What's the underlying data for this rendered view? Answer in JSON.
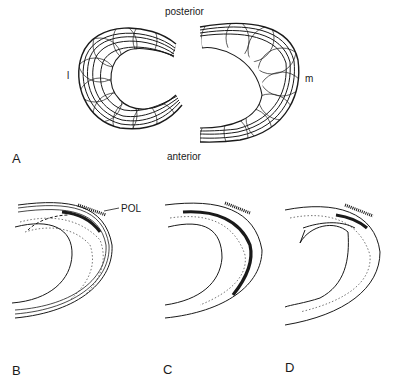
{
  "figure": {
    "panel_a": {
      "letter": "A",
      "labels": {
        "top": "posterior",
        "bottom": "anterior",
        "left": "l",
        "right": "m"
      },
      "description": "Lateral and medial meniscus fibre pattern, top view"
    },
    "panel_b": {
      "letter": "B",
      "callout": "POL"
    },
    "panel_c": {
      "letter": "C"
    },
    "panel_d": {
      "letter": "D"
    },
    "colors": {
      "ink": "#1a1a1a",
      "background": "#ffffff"
    }
  }
}
